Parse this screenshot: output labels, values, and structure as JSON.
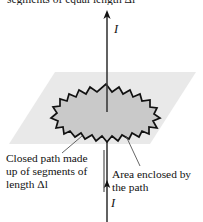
{
  "figure": {
    "top_clipped_text": "segments of equal length Δl",
    "current_label_top": "I",
    "current_label_bottom": "I",
    "caption_left": "Closed path made up of segments of length Δl",
    "caption_right": "Area enclosed by the path",
    "colors": {
      "plane_fill": "#e9e9e9",
      "loop_fill": "#c9c9c9",
      "outline": "#111111",
      "wire": "#3a3a3a",
      "leader": "#555555",
      "text": "#111111"
    },
    "elements": {
      "plane_name": "current-carrying-plane",
      "loop_name": "closed-amperian-loop",
      "wire_name": "current-carrying-wire",
      "arrow_top_name": "current-arrow-top",
      "arrow_bottom_name": "current-arrow-bottom",
      "divider_name": "caption-divider"
    }
  }
}
